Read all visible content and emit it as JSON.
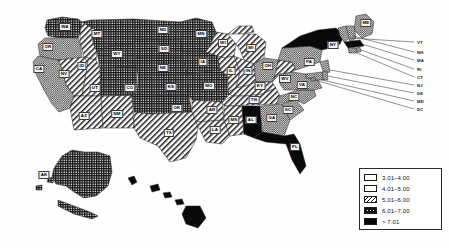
{
  "figure": {
    "type": "choropleth-map",
    "region": "United States"
  },
  "legend": {
    "title": "",
    "items": [
      {
        "label": "3.01–4.00",
        "pattern": "white",
        "swatch_class": "sw-c1"
      },
      {
        "label": "4.01–5.00",
        "pattern": "stipple",
        "swatch_class": "sw-c2"
      },
      {
        "label": "5.01–6.00",
        "pattern": "diagonal",
        "swatch_class": "sw-c3"
      },
      {
        "label": "6.01–7.00",
        "pattern": "crosshatch",
        "swatch_class": "sw-c4"
      },
      {
        "label": "> 7.01",
        "pattern": "solid",
        "swatch_class": "sw-c5"
      }
    ]
  },
  "chart_data": {
    "type": "map",
    "title": "",
    "legend_position": "bottom-right",
    "classes": [
      "3.01–4.00",
      "4.01–5.00",
      "5.01–6.00",
      "6.01–7.00",
      "> 7.01"
    ],
    "categories": [
      "WA",
      "OR",
      "CA",
      "NV",
      "ID",
      "MT",
      "WY",
      "UT",
      "AZ",
      "NM",
      "CO",
      "ND",
      "SD",
      "NE",
      "KS",
      "OK",
      "TX",
      "MN",
      "IA",
      "MO",
      "AR",
      "LA",
      "WI",
      "IL",
      "MI",
      "IN",
      "OH",
      "KY",
      "TN",
      "MS",
      "AL",
      "GA",
      "FL",
      "SC",
      "NC",
      "VA",
      "WV",
      "PA",
      "NY",
      "ME",
      "VT",
      "NH",
      "MA",
      "RI",
      "CT",
      "NJ",
      "DE",
      "MD",
      "DC",
      "AK",
      "HI"
    ],
    "values": [
      "6.01–7.00",
      "4.01–5.00",
      "4.01–5.00",
      "5.01–6.00",
      "5.01–6.00",
      "6.01–7.00",
      "6.01–7.00",
      "5.01–6.00",
      "5.01–6.00",
      "5.01–6.00",
      "6.01–7.00",
      "6.01–7.00",
      "6.01–7.00",
      "6.01–7.00",
      "6.01–7.00",
      "6.01–7.00",
      "5.01–6.00",
      "6.01–7.00",
      "6.01–7.00",
      "6.01–7.00",
      "6.01–7.00",
      "5.01–6.00",
      "5.01–6.00",
      "5.01–6.00",
      "5.01–6.00",
      "5.01–6.00",
      "4.01–5.00",
      "5.01–6.00",
      "5.01–6.00",
      "5.01–6.00",
      "> 7.01",
      "4.01–5.00",
      "> 7.01",
      "4.01–5.00",
      "4.01–5.00",
      "4.01–5.00",
      "5.01–6.00",
      "4.01–5.00",
      "> 7.01",
      "4.01–5.00",
      "4.01–5.00",
      "4.01–5.00",
      "> 7.01",
      "4.01–5.00",
      "4.01–5.00",
      "4.01–5.00",
      "4.01–5.00",
      "4.01–5.00",
      "4.01–5.00",
      "6.01–7.00",
      "> 7.01"
    ]
  },
  "state_labels": [
    {
      "abbr": "WA",
      "x": 65,
      "y": 27
    },
    {
      "abbr": "OR",
      "x": 48,
      "y": 47
    },
    {
      "abbr": "CA",
      "x": 39,
      "y": 69
    },
    {
      "abbr": "NV",
      "x": 64,
      "y": 74
    },
    {
      "abbr": "ID",
      "x": 82,
      "y": 66
    },
    {
      "abbr": "MT",
      "x": 97,
      "y": 34
    },
    {
      "abbr": "WY",
      "x": 117,
      "y": 54
    },
    {
      "abbr": "UT",
      "x": 95,
      "y": 88
    },
    {
      "abbr": "AZ",
      "x": 84,
      "y": 116
    },
    {
      "abbr": "NM",
      "x": 117,
      "y": 114
    },
    {
      "abbr": "CO",
      "x": 130,
      "y": 88
    },
    {
      "abbr": "ND",
      "x": 163,
      "y": 30
    },
    {
      "abbr": "SD",
      "x": 164,
      "y": 49
    },
    {
      "abbr": "NE",
      "x": 163,
      "y": 68
    },
    {
      "abbr": "KS",
      "x": 171,
      "y": 87
    },
    {
      "abbr": "OK",
      "x": 177,
      "y": 108
    },
    {
      "abbr": "TX",
      "x": 169,
      "y": 133
    },
    {
      "abbr": "MN",
      "x": 201,
      "y": 34
    },
    {
      "abbr": "IA",
      "x": 203,
      "y": 62
    },
    {
      "abbr": "MO",
      "x": 209,
      "y": 86
    },
    {
      "abbr": "AR",
      "x": 212,
      "y": 110
    },
    {
      "abbr": "LA",
      "x": 215,
      "y": 130
    },
    {
      "abbr": "WI",
      "x": 223,
      "y": 43
    },
    {
      "abbr": "IL",
      "x": 231,
      "y": 71
    },
    {
      "abbr": "MI",
      "x": 251,
      "y": 48
    },
    {
      "abbr": "IN",
      "x": 248,
      "y": 71
    },
    {
      "abbr": "OH",
      "x": 268,
      "y": 66
    },
    {
      "abbr": "KY",
      "x": 260,
      "y": 86
    },
    {
      "abbr": "TN",
      "x": 254,
      "y": 100
    },
    {
      "abbr": "MS",
      "x": 234,
      "y": 120
    },
    {
      "abbr": "AL",
      "x": 251,
      "y": 120
    },
    {
      "abbr": "GA",
      "x": 272,
      "y": 118
    },
    {
      "abbr": "FL",
      "x": 295,
      "y": 147
    },
    {
      "abbr": "SC",
      "x": 288,
      "y": 110
    },
    {
      "abbr": "NC",
      "x": 294,
      "y": 97
    },
    {
      "abbr": "VA",
      "x": 302,
      "y": 85
    },
    {
      "abbr": "WV",
      "x": 285,
      "y": 79
    },
    {
      "abbr": "PA",
      "x": 309,
      "y": 62
    },
    {
      "abbr": "NY",
      "x": 333,
      "y": 45
    },
    {
      "abbr": "ME",
      "x": 366,
      "y": 23
    },
    {
      "abbr": "AK",
      "x": 44,
      "y": 175
    }
  ],
  "callout_labels": [
    {
      "abbr": "VT",
      "x": 417,
      "y": 42
    },
    {
      "abbr": "NH",
      "x": 417,
      "y": 52
    },
    {
      "abbr": "MA",
      "x": 417,
      "y": 60
    },
    {
      "abbr": "RI",
      "x": 417,
      "y": 69
    },
    {
      "abbr": "CT",
      "x": 417,
      "y": 77
    },
    {
      "abbr": "NJ",
      "x": 417,
      "y": 85
    },
    {
      "abbr": "DE",
      "x": 417,
      "y": 93
    },
    {
      "abbr": "MD",
      "x": 417,
      "y": 101
    },
    {
      "abbr": "DC",
      "x": 417,
      "y": 109
    }
  ]
}
